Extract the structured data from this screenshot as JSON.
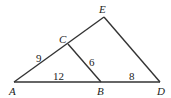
{
  "diagram": {
    "points": {
      "A": {
        "label": "A",
        "x": 14,
        "y": 82
      },
      "B": {
        "label": "B",
        "x": 101,
        "y": 82
      },
      "D": {
        "label": "D",
        "x": 160,
        "y": 82
      },
      "C": {
        "label": "C",
        "x": 68,
        "y": 44
      },
      "E": {
        "label": "E",
        "x": 104,
        "y": 17
      }
    },
    "segments": [
      {
        "from": "A",
        "to": "D"
      },
      {
        "from": "A",
        "to": "E"
      },
      {
        "from": "E",
        "to": "D"
      },
      {
        "from": "C",
        "to": "B"
      }
    ],
    "lengths": {
      "AC": "9",
      "CB": "6",
      "AB": "12",
      "BD": "8"
    }
  }
}
